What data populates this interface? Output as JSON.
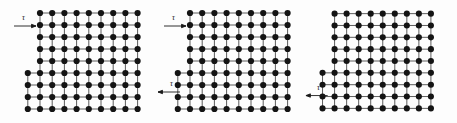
{
  "figure": {
    "background_color": "#fdfdfd",
    "atom_color": "#141414",
    "bond_color": "#4a4a4a",
    "arrow_color": "#1a1a1a",
    "atom_radius": 3.1,
    "bond_width": 0.9,
    "lattice_spacing_x": 12.2,
    "lattice_spacing_y": 12.0
  },
  "shear_symbol": "τ",
  "panels": [
    {
      "id": "panel-1",
      "caption": "",
      "stage": "dislocation at left",
      "dislocation_column": 3,
      "slip_plane_row": 5,
      "grid": {
        "columns": 9,
        "rows": 9,
        "origin_x": 40,
        "origin_y": 13
      },
      "arrows": [
        {
          "name": "shear-arrow-top",
          "label": "τ",
          "direction": "right",
          "x": 14,
          "y": 26,
          "length": 26,
          "label_x": 24,
          "label_y": 17
        }
      ]
    },
    {
      "id": "panel-2",
      "caption": "",
      "stage": "dislocation at centre",
      "dislocation_column": 6,
      "slip_plane_row": 5,
      "grid": {
        "columns": 9,
        "rows": 9,
        "origin_x": 38,
        "origin_y": 13
      },
      "arrows": [
        {
          "name": "shear-arrow-top",
          "label": "τ",
          "direction": "right",
          "x": 12,
          "y": 26,
          "length": 26,
          "label_x": 22,
          "label_y": 17
        },
        {
          "name": "shear-arrow-bottom",
          "label": "τ",
          "direction": "left",
          "x": 4,
          "y": 92,
          "length": 26,
          "label_x": 20,
          "label_y": 83
        }
      ]
    },
    {
      "id": "panel-3",
      "caption": "",
      "stage": "slip step formed at surface",
      "dislocation_column": 9,
      "slip_plane_row": 5,
      "grid": {
        "columns": 9,
        "rows": 9,
        "origin_x": 32,
        "origin_y": 13
      },
      "arrows": [
        {
          "name": "shear-arrow-bottom",
          "label": "τ",
          "direction": "left",
          "x": 2,
          "y": 96,
          "length": 24,
          "label_x": 16,
          "label_y": 87
        }
      ]
    }
  ]
}
